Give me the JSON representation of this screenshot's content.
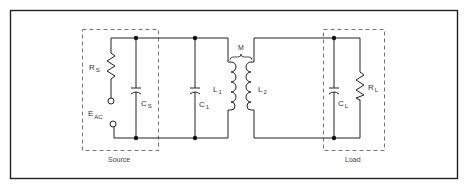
{
  "diagram": {
    "type": "circuit-schematic",
    "blocks": {
      "source": {
        "caption": "Source"
      },
      "load": {
        "caption": "Load"
      }
    },
    "components": {
      "rs": {
        "letter": "R",
        "sub": "S"
      },
      "cs": {
        "letter": "C",
        "sub": "S"
      },
      "eac": {
        "letter": "E",
        "sub": "AC"
      },
      "c1": {
        "letter": "C",
        "sub": "1"
      },
      "l1": {
        "letter": "L",
        "sub": "1"
      },
      "l2": {
        "letter": "L",
        "sub": "2"
      },
      "m": {
        "letter": "M"
      },
      "cl": {
        "letter": "C",
        "sub": "L"
      },
      "rl": {
        "letter": "R",
        "sub": "L"
      }
    },
    "colors": {
      "line": "#222222",
      "dash": "#666666",
      "background": "#ffffff"
    }
  }
}
